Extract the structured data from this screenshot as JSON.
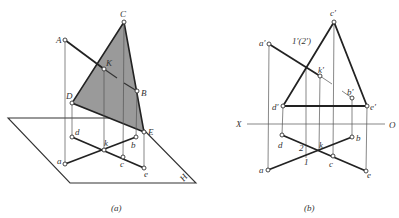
{
  "figure_a": {
    "caption": "(a)",
    "plane_label": "H",
    "space_points": {
      "A": "A",
      "B": "B",
      "C": "C",
      "D": "D",
      "E": "E",
      "K": "K"
    },
    "projection_points": {
      "a": "a",
      "b": "b",
      "c": "c",
      "d": "d",
      "e": "e",
      "k": "k"
    },
    "colors": {
      "triangle_fill": "#9a9a9a",
      "line": "#222222"
    }
  },
  "figure_b": {
    "caption": "(b)",
    "axis_labels": {
      "x": "X",
      "o": "O"
    },
    "front_points": {
      "a": "a′",
      "b": "b′",
      "c": "c′",
      "d": "d′",
      "e": "e′",
      "k": "k′"
    },
    "top_points": {
      "a": "a",
      "b": "b",
      "c": "c",
      "d": "d",
      "e": "e",
      "k": "k"
    },
    "coincident_label": "1′(2′)",
    "point_1": "1",
    "point_2": "2"
  }
}
